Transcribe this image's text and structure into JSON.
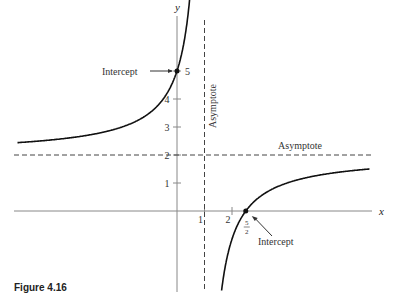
{
  "caption": "Figure 4.16",
  "chart_data": {
    "type": "line",
    "title": "",
    "xlabel": "x",
    "ylabel": "y",
    "function": "y = (2x - 5)/(x - 1)",
    "y_ticks": [
      "1",
      "2",
      "3",
      "4",
      "5"
    ],
    "x_ticks": [
      "1",
      "2"
    ],
    "xlim": [
      -6.2,
      8.2
    ],
    "ylim": [
      -1.9,
      7.6
    ],
    "asymptotes": {
      "vertical_x": 1,
      "horizontal_y": 2,
      "vertical_label": "Asymptote",
      "horizontal_label": "Asymptote"
    },
    "intercepts": [
      {
        "label": "Intercept",
        "x": 0,
        "y": 5,
        "value_label": "5"
      },
      {
        "label": "Intercept",
        "x": 2.5,
        "y": 0,
        "value_label": "5/2"
      }
    ],
    "grid": false
  }
}
